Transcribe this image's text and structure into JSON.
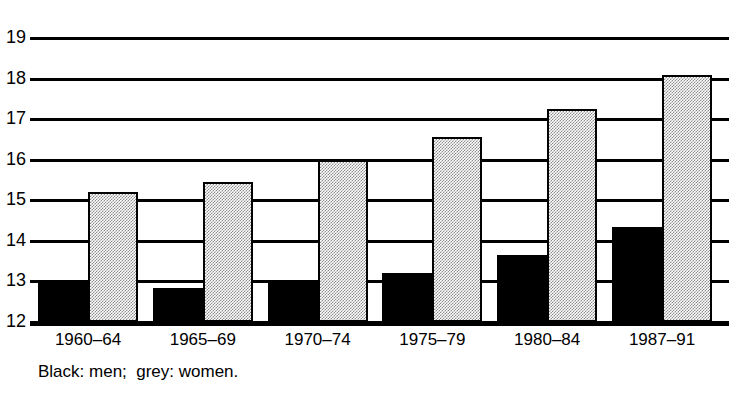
{
  "chart_data": {
    "type": "bar",
    "title": "",
    "subtitle": "",
    "xlabel": "",
    "ylabel": "",
    "categories": [
      "1960–64",
      "1965–69",
      "1970–74",
      "1975–79",
      "1980–84",
      "1987–91"
    ],
    "series": [
      {
        "name": "men",
        "color": "#000000",
        "values": [
          13.0,
          12.85,
          13.0,
          13.2,
          13.65,
          14.35
        ]
      },
      {
        "name": "women",
        "color": "#8d8d8d",
        "values": [
          15.2,
          15.45,
          16.0,
          16.55,
          17.25,
          18.1
        ]
      }
    ],
    "ylim": [
      12,
      19
    ],
    "ytick_labels": [
      "19",
      "18",
      "17",
      "16",
      "15",
      "14",
      "13",
      "12"
    ],
    "ytick_values": [
      19,
      18,
      17,
      16,
      15,
      14,
      13,
      12
    ],
    "grid": "horizontal",
    "legend_position": "below-axis-caption",
    "caption": "Black: men;  grey: women.",
    "legend_entries": [
      {
        "label": "Black: men",
        "color": "#000000"
      },
      {
        "label": "grey: women",
        "color": "#8d8d8d"
      }
    ]
  }
}
